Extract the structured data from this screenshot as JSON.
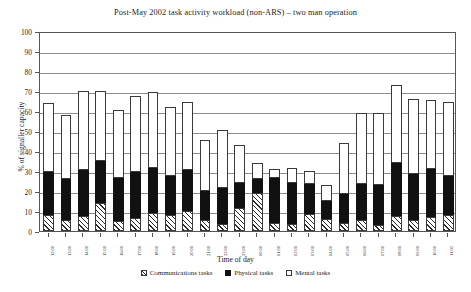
{
  "chart_data": {
    "type": "bar",
    "subtype": "stacked-column",
    "title": "Post-May 2002 task activity workload (non-ARS) – two man operation",
    "xlabel": "Time of day",
    "ylabel": "% of signaller capacity",
    "ylim": [
      0,
      100
    ],
    "ytick_step": 10,
    "yticks": [
      0,
      10,
      20,
      30,
      40,
      50,
      60,
      70,
      80,
      90,
      100
    ],
    "grid": true,
    "grid_axis": "y",
    "legend_position": "bottom",
    "categories": [
      "12:00",
      "13:00",
      "14:00",
      "15:00",
      "16:00",
      "17:00",
      "18:00",
      "19:00",
      "20:00",
      "21:00",
      "22:00",
      "23:00",
      "00:00",
      "01:00",
      "02:00",
      "03:00",
      "04:00",
      "05:00",
      "06:00",
      "07:00",
      "08:00",
      "09:00",
      "10:00",
      "11:00"
    ],
    "series": [
      {
        "name": "Communications tasks",
        "pattern": "diagonal-hatch",
        "color": "#ffffff",
        "values": [
          8,
          5.5,
          7.5,
          14,
          5,
          6.5,
          9,
          8,
          10,
          5.5,
          3.5,
          11.5,
          19,
          4,
          3.5,
          8.5,
          6,
          4,
          5.5,
          3,
          7.5,
          5.5,
          7,
          8
        ]
      },
      {
        "name": "Physical tasks",
        "pattern": "solid",
        "color": "#111111",
        "values": [
          21.5,
          20.5,
          23,
          21,
          21.5,
          23,
          22.5,
          19.5,
          20.5,
          14.5,
          18,
          12.5,
          7,
          22.5,
          20.5,
          15,
          9,
          14.5,
          18,
          20,
          26.5,
          23,
          24,
          19.5
        ]
      },
      {
        "name": "Mental tasks",
        "pattern": "open",
        "color": "#ffffff",
        "values": [
          34.5,
          32,
          39.5,
          35,
          34,
          38,
          38,
          34.5,
          34,
          25.5,
          29,
          19,
          8,
          4.5,
          7.5,
          6.5,
          8,
          25.5,
          35.5,
          36,
          39,
          37.5,
          34.5,
          37
        ]
      }
    ],
    "totals": [
      64,
      58,
      70,
      70,
      60.5,
      67.5,
      69.5,
      62,
      64.5,
      45.5,
      50.5,
      43,
      34,
      31,
      31.5,
      30,
      23,
      44,
      59,
      59,
      73,
      66,
      65.5,
      64.5
    ]
  },
  "legend": {
    "items": [
      {
        "label": "Communications tasks",
        "swatch": "hatched-swatch-icon"
      },
      {
        "label": "Physical tasks",
        "swatch": "filled-swatch-icon"
      },
      {
        "label": "Mental tasks",
        "swatch": "open-swatch-icon"
      }
    ]
  }
}
